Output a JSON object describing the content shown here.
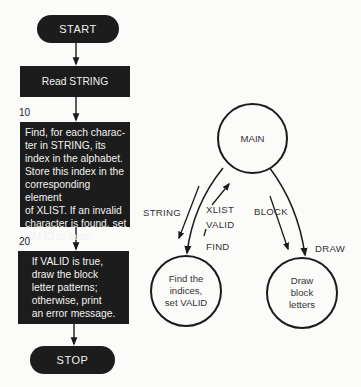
{
  "flowchart": {
    "start_label": "START",
    "read_step": "Read STRING",
    "step10": {
      "number": "10",
      "text": "Find, for each charac-\nter in STRING, its\nindex in the alphabet.\nStore this index in the\ncorresponding element\nof XLIST. If an invalid\ncharacter is found, set\nVALID to false."
    },
    "step20": {
      "number": "20",
      "text": "If VALID is true,\ndraw the block\nletter patterns;\notherwise, print\nan error message."
    },
    "stop_label": "STOP"
  },
  "structure_chart": {
    "main_module": "MAIN",
    "find_module": "Find the\nindices,\nset VALID",
    "draw_module": "Draw\nblock\nletters",
    "labels": {
      "string": "STRING",
      "xlist": "XLIST",
      "valid": "VALID",
      "find": "FIND",
      "block": "BLOCK",
      "draw": "DRAW"
    }
  },
  "colors": {
    "box_fill": "#1c1c1c",
    "box_text": "#f2f2f2",
    "line": "#1a1a1a",
    "background": "#fbfbfa"
  }
}
